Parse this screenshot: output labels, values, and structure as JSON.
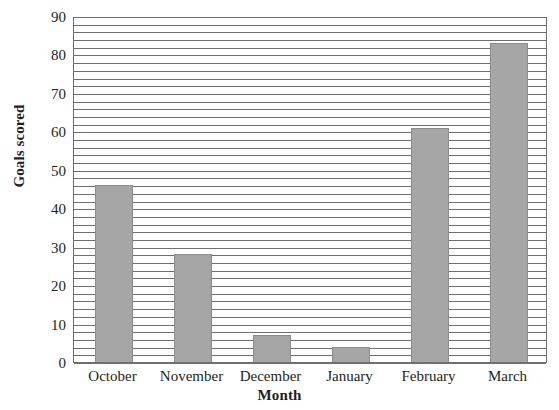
{
  "chart_data": {
    "type": "bar",
    "title": "",
    "subtitle": "",
    "xlabel": "Month",
    "ylabel": "Goals scored",
    "categories": [
      "October",
      "November",
      "December",
      "January",
      "February",
      "March"
    ],
    "values": [
      46,
      28,
      7,
      4,
      61,
      83
    ],
    "ylim": [
      0,
      90
    ],
    "y_tick_step": 10,
    "y_tick_labels": [
      "0",
      "10",
      "20",
      "30",
      "40",
      "50",
      "60",
      "70",
      "80",
      "90"
    ],
    "gridline_step": 2,
    "grid": true,
    "legend": null,
    "legend_position": "none",
    "annotations": [],
    "colors": {
      "bar_fill": "#a6a6a6",
      "bar_edge": "#8c8c8c",
      "gridline": "#6f6f6f",
      "axis": "#6f6f6f",
      "text": "#231f20",
      "background": "#ffffff"
    }
  }
}
